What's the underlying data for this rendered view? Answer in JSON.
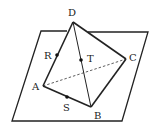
{
  "diagram": {
    "type": "geometry",
    "vertices": {
      "A": {
        "label": "A",
        "x": 43,
        "y": 86
      },
      "B": {
        "label": "B",
        "x": 91,
        "y": 107
      },
      "C": {
        "label": "C",
        "x": 126,
        "y": 59
      },
      "D": {
        "label": "D",
        "x": 73,
        "y": 22
      }
    },
    "points": {
      "R": {
        "label": "R",
        "x": 57,
        "y": 55
      },
      "T": {
        "label": "T",
        "x": 81,
        "y": 60
      },
      "S": {
        "label": "S",
        "x": 67,
        "y": 97
      }
    },
    "plane": [
      [
        41,
        31
      ],
      [
        148,
        32
      ],
      [
        122,
        121
      ],
      [
        12,
        121
      ]
    ],
    "dashed_edges": [
      [
        "A",
        "C"
      ]
    ],
    "solid_edges": [
      [
        "D",
        "A"
      ],
      [
        "D",
        "B"
      ],
      [
        "D",
        "C"
      ],
      [
        "A",
        "B"
      ],
      [
        "B",
        "C"
      ]
    ],
    "colors": {
      "line": "#222222",
      "background": "#ffffff"
    }
  }
}
